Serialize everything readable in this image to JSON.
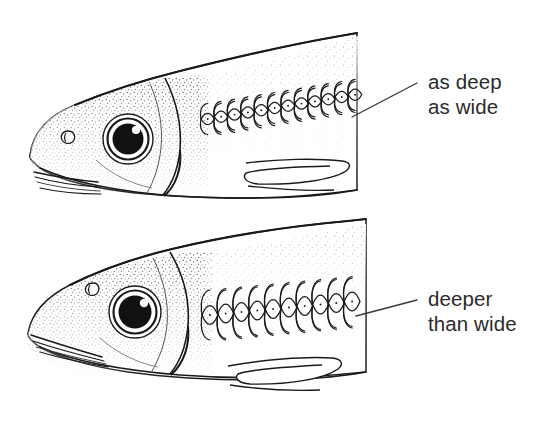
{
  "figure": {
    "background_color": "#ffffff",
    "ink_color": "#1a1a1a",
    "text_color": "#2b2b2b",
    "width": 550,
    "height": 434
  },
  "annotations": [
    {
      "id": "upper",
      "line1": "as deep",
      "line2": "as wide",
      "text_x": 428,
      "line1_y": 89,
      "line2_y": 114,
      "leader": {
        "x1": 352,
        "y1": 117,
        "x2": 417,
        "y2": 83
      }
    },
    {
      "id": "lower",
      "line1": "deeper",
      "line2": "than wide",
      "text_x": 428,
      "line1_y": 306,
      "line2_y": 331,
      "leader": {
        "x1": 356,
        "y1": 316,
        "x2": 417,
        "y2": 300
      }
    }
  ],
  "specimens": [
    {
      "id": "upper-fish",
      "label": "upper fish as deep as wide scales",
      "scale_count": 12,
      "scale_width": 13.4,
      "scale_height": 15.0,
      "scale_row_start_x": 201,
      "scale_row_y": 119,
      "snout_shape": "blunt rounded",
      "mouth": "horizontal subterminal",
      "eye": {
        "cx": 128,
        "cy": 139,
        "r_outer": 25,
        "r_iris": 20,
        "r_pupil": 15,
        "highlight_r": 4
      }
    },
    {
      "id": "lower-fish",
      "label": "lower fish deeper than wide scales",
      "scale_count": 10,
      "scale_width": 15.8,
      "scale_height": 25.0,
      "scale_row_start_x": 202,
      "scale_row_y": 315,
      "snout_shape": "pointed angular",
      "mouth": "upturned oblique",
      "eye": {
        "cx": 135,
        "cy": 312,
        "r_outer": 26,
        "r_iris": 21,
        "r_pupil": 16,
        "highlight_r": 4
      }
    }
  ]
}
